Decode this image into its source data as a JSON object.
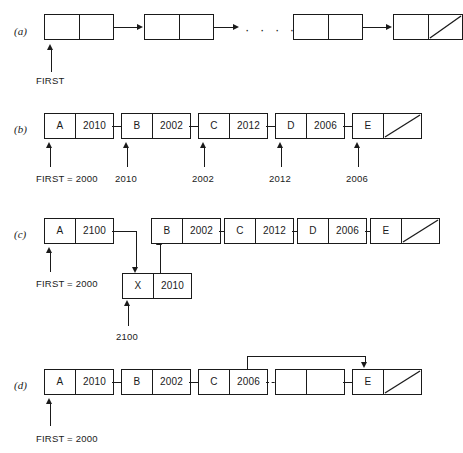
{
  "figure": {
    "ink_color": "#1a1a1a",
    "background": "#ffffff"
  },
  "panels": [
    {
      "label": "(a)",
      "caption": "Abstract linked list with FIRST pointer and null terminator",
      "pointer_label": "FIRST",
      "ellipsis": "· · · ·",
      "nodes": [
        {
          "data": "",
          "ptr": "",
          "null": false
        },
        {
          "data": "",
          "ptr": "",
          "null": false
        },
        {
          "data": "",
          "ptr": "",
          "null": false
        },
        {
          "data": "",
          "ptr": "",
          "null": true
        }
      ]
    },
    {
      "label": "(b)",
      "caption": "Linked list with actual storage addresses",
      "nodes": [
        {
          "data": "A",
          "ptr": "2010",
          "null": false
        },
        {
          "data": "B",
          "ptr": "2002",
          "null": false
        },
        {
          "data": "C",
          "ptr": "2012",
          "null": false
        },
        {
          "data": "D",
          "ptr": "2006",
          "null": false
        },
        {
          "data": "E",
          "ptr": "",
          "null": true
        }
      ],
      "addresses": [
        "FIRST = 2000",
        "2010",
        "2002",
        "2012",
        "2006"
      ]
    },
    {
      "label": "(c)",
      "caption": "Insertion of node X between A and B",
      "pointer_label": "FIRST = 2000",
      "new_node_address": "2100",
      "nodes": [
        {
          "data": "A",
          "ptr": "2100",
          "null": false
        },
        {
          "data": "B",
          "ptr": "2002",
          "null": false
        },
        {
          "data": "C",
          "ptr": "2012",
          "null": false
        },
        {
          "data": "D",
          "ptr": "2006",
          "null": false
        },
        {
          "data": "E",
          "ptr": "",
          "null": true
        }
      ],
      "inserted_node": {
        "data": "X",
        "ptr": "2010"
      }
    },
    {
      "label": "(d)",
      "caption": "Deletion of node D by bypassing it from C to E",
      "pointer_label": "FIRST = 2000",
      "nodes": [
        {
          "data": "A",
          "ptr": "2010",
          "null": false
        },
        {
          "data": "B",
          "ptr": "2002",
          "null": false
        },
        {
          "data": "C",
          "ptr": "2006",
          "null": false
        },
        {
          "data": "",
          "ptr": "",
          "null": false
        },
        {
          "data": "E",
          "ptr": "",
          "null": true
        }
      ]
    }
  ]
}
